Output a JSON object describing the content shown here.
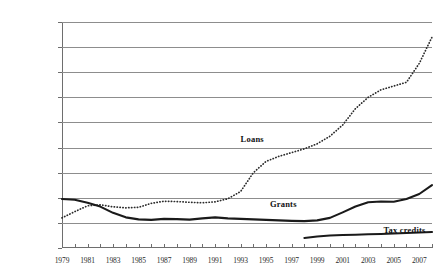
{
  "chart_data": {
    "type": "line",
    "title": "",
    "subtitle": "",
    "xlabel": "",
    "ylabel": "",
    "xlim": [
      1979,
      2008
    ],
    "ylim": [
      0,
      90
    ],
    "ytick_values": [
      0,
      10,
      20,
      30,
      40,
      50,
      60,
      70,
      80,
      90
    ],
    "ytick_labels": [
      "$0",
      "$10",
      "$20",
      "$30",
      "$40",
      "$50",
      "$60",
      "$70",
      "$80",
      "$90"
    ],
    "xtick_values": [
      1979,
      1980,
      1981,
      1982,
      1983,
      1984,
      1985,
      1986,
      1987,
      1988,
      1989,
      1990,
      1991,
      1992,
      1993,
      1994,
      1995,
      1996,
      1997,
      1998,
      1999,
      2000,
      2001,
      2002,
      2003,
      2004,
      2005,
      2006,
      2007,
      2008
    ],
    "xtick_labels_shown": [
      "1979",
      "1981",
      "1983",
      "1985",
      "1987",
      "1989",
      "1991",
      "1993",
      "1995",
      "1997",
      "1999",
      "2001",
      "2003",
      "2005",
      "2007"
    ],
    "grid": true,
    "grid_axis": "y",
    "legend_position": "inline-annotations",
    "series": [
      {
        "name": "Loans",
        "style": "dotted",
        "color": "#2b2b2b",
        "x": [
          1979,
          1980,
          1981,
          1982,
          1983,
          1984,
          1985,
          1986,
          1987,
          1988,
          1989,
          1990,
          1991,
          1992,
          1993,
          1994,
          1995,
          1996,
          1997,
          1998,
          1999,
          2000,
          2001,
          2002,
          2003,
          2004,
          2005,
          2006,
          2007,
          2008
        ],
        "values": [
          12.0,
          14.5,
          16.8,
          17.2,
          16.4,
          16.0,
          16.2,
          17.8,
          18.6,
          18.5,
          18.2,
          18.0,
          18.4,
          19.6,
          22.5,
          30.0,
          34.5,
          36.5,
          38.0,
          39.5,
          41.5,
          44.5,
          49.0,
          55.5,
          60.0,
          63.0,
          64.5,
          66.0,
          73.5,
          84.0
        ]
      },
      {
        "name": "Grants",
        "style": "solid",
        "color": "#1a1a1a",
        "x": [
          1979,
          1980,
          1981,
          1982,
          1983,
          1984,
          1985,
          1986,
          1987,
          1988,
          1989,
          1990,
          1991,
          1992,
          1993,
          1994,
          1995,
          1996,
          1997,
          1998,
          1999,
          2000,
          2001,
          2002,
          2003,
          2004,
          2005,
          2006,
          2007,
          2008
        ],
        "values": [
          19.5,
          19.2,
          18.0,
          16.5,
          14.0,
          12.2,
          11.4,
          11.2,
          11.6,
          11.5,
          11.3,
          11.8,
          12.2,
          11.8,
          11.6,
          11.4,
          11.2,
          11.0,
          10.8,
          10.7,
          11.0,
          12.0,
          14.2,
          16.5,
          18.2,
          18.5,
          18.4,
          19.5,
          21.5,
          25.0
        ]
      },
      {
        "name": "Tax credits",
        "style": "solid",
        "color": "#1a1a1a",
        "x": [
          1998,
          1999,
          2000,
          2001,
          2002,
          2003,
          2004,
          2005,
          2006,
          2007,
          2008
        ],
        "values": [
          4.0,
          4.6,
          5.0,
          5.2,
          5.3,
          5.5,
          5.6,
          5.8,
          6.0,
          6.2,
          6.4
        ]
      }
    ],
    "annotations": [
      {
        "text": "Loans",
        "x": 1993.0,
        "y": 43.0
      },
      {
        "text": "Grants",
        "x": 1995.3,
        "y": 17.2
      },
      {
        "text": "Tax credits",
        "x": 2004.2,
        "y": 6.6
      }
    ]
  }
}
